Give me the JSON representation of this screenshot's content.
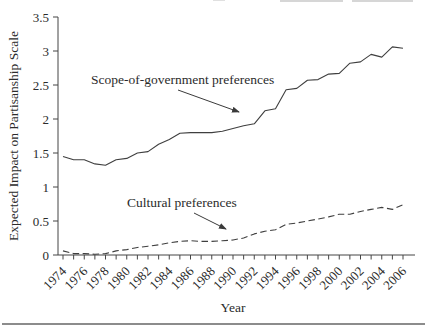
{
  "chart_data": {
    "type": "line",
    "title": "",
    "xlabel": "Year",
    "ylabel": "Expected Impact on Partisanship Scale",
    "xlim": [
      1974,
      2006
    ],
    "ylim": [
      0,
      3.5
    ],
    "ytick_labels": [
      "0",
      "0.5",
      "1",
      "1.5",
      "2",
      "2.5",
      "3",
      "3.5"
    ],
    "xtick_labels": [
      "1974",
      "1976",
      "1978",
      "1980",
      "1982",
      "1984",
      "1986",
      "1988",
      "1990",
      "1992",
      "1994",
      "1996",
      "1998",
      "2000",
      "2002",
      "2004",
      "2006"
    ],
    "xtick_minor_interval_years": 1,
    "grid": false,
    "legend_position": "none (series labeled by in-plot annotations with arrows)",
    "line_color": "#3f3f3f",
    "text_color": "#2b2b2b",
    "x": [
      1974,
      1975,
      1976,
      1977,
      1978,
      1979,
      1980,
      1981,
      1982,
      1983,
      1984,
      1985,
      1986,
      1987,
      1988,
      1989,
      1990,
      1991,
      1992,
      1993,
      1994,
      1995,
      1996,
      1997,
      1998,
      1999,
      2000,
      2001,
      2002,
      2003,
      2004,
      2005,
      2006
    ],
    "series": [
      {
        "name": "Scope-of-government preferences",
        "line_style": "solid",
        "values": [
          1.45,
          1.4,
          1.4,
          1.34,
          1.32,
          1.4,
          1.42,
          1.5,
          1.52,
          1.63,
          1.7,
          1.79,
          1.8,
          1.8,
          1.8,
          1.82,
          1.86,
          1.9,
          1.93,
          2.12,
          2.15,
          2.43,
          2.45,
          2.57,
          2.58,
          2.66,
          2.67,
          2.82,
          2.84,
          2.95,
          2.91,
          3.06,
          3.04
        ]
      },
      {
        "name": "Cultural preferences",
        "line_style": "dashed",
        "values": [
          0.06,
          0.02,
          0.02,
          0.01,
          0.02,
          0.06,
          0.08,
          0.11,
          0.13,
          0.15,
          0.18,
          0.2,
          0.21,
          0.2,
          0.2,
          0.21,
          0.22,
          0.25,
          0.31,
          0.35,
          0.37,
          0.45,
          0.47,
          0.5,
          0.53,
          0.56,
          0.6,
          0.6,
          0.64,
          0.67,
          0.7,
          0.67,
          0.74
        ]
      }
    ],
    "annotations": [
      {
        "text": "Scope-of-government preferences",
        "points_to_year": 1991,
        "points_to_value": 2.0
      },
      {
        "text": "Cultural preferences",
        "points_to_year": 1990,
        "points_to_value": 0.3
      }
    ]
  }
}
